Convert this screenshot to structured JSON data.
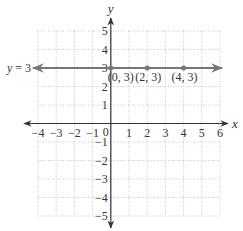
{
  "chart_data": {
    "type": "line",
    "title": "",
    "xlabel": "x",
    "ylabel": "y",
    "xlim": [
      -4,
      6
    ],
    "ylim": [
      -5,
      5
    ],
    "grid": true,
    "x_ticks": [
      {
        "value": -4,
        "label": "−4"
      },
      {
        "value": -3,
        "label": "−3"
      },
      {
        "value": -2,
        "label": "−2"
      },
      {
        "value": -1,
        "label": "−1"
      },
      {
        "value": 1,
        "label": "1"
      },
      {
        "value": 2,
        "label": "2"
      },
      {
        "value": 3,
        "label": "3"
      },
      {
        "value": 4,
        "label": "4"
      },
      {
        "value": 5,
        "label": "5"
      },
      {
        "value": 6,
        "label": "6"
      }
    ],
    "y_ticks": [
      {
        "value": 5,
        "label": "5"
      },
      {
        "value": 4,
        "label": "4"
      },
      {
        "value": 3,
        "label": "3"
      },
      {
        "value": 2,
        "label": "2"
      },
      {
        "value": 1,
        "label": "1"
      },
      {
        "value": -1,
        "label": "−1"
      },
      {
        "value": -2,
        "label": "−2"
      },
      {
        "value": -3,
        "label": "−3"
      },
      {
        "value": -4,
        "label": "−4"
      },
      {
        "value": -5,
        "label": "−5"
      }
    ],
    "origin_label": "0",
    "series": [
      {
        "name": "y = 3",
        "equation_label": "y = 3",
        "y_constant": 3,
        "color": "#777777",
        "points": [
          {
            "x": 0,
            "y": 3,
            "label": "(0, 3)"
          },
          {
            "x": 2,
            "y": 3,
            "label": "(2, 3)"
          },
          {
            "x": 4,
            "y": 3,
            "label": "(4, 3)"
          }
        ]
      }
    ]
  }
}
